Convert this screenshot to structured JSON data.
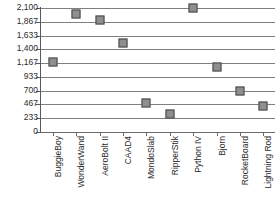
{
  "chart_data": {
    "type": "scatter",
    "title": "",
    "subtitle": "",
    "xlabel": "",
    "ylabel": "",
    "categories": [
      "BuggieBoy",
      "WonderWand",
      "AeroBolt II",
      "CAAD4",
      "MondoSlab",
      "RipperStik",
      "Python IV",
      "Bjorn",
      "RocketBoard",
      "Lightning Rod"
    ],
    "values": [
      1180,
      1990,
      1900,
      1500,
      490,
      300,
      2100,
      1100,
      700,
      440
    ],
    "ylim": [
      0,
      2100
    ],
    "ytick_labels": [
      "2,100",
      "1,867",
      "1,633",
      "1,400",
      "1,167",
      "933",
      "700",
      "467",
      "233",
      "0"
    ],
    "ytick_values": [
      2100,
      1867,
      1633,
      1400,
      1167,
      933,
      700,
      467,
      233,
      0
    ],
    "grid": true,
    "legend": false,
    "marker_shape": "square",
    "marker_fill": "#8f8f8f",
    "marker_stroke": "#4a4a4a",
    "grid_color": "#7f7f7f",
    "axis_color": "#5a5a5a",
    "text_color": "#2b2b2b",
    "background": "#ffffff"
  }
}
